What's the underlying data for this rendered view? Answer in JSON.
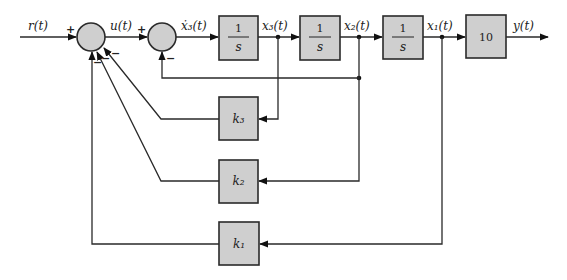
{
  "diagram": {
    "signals": {
      "input": "r(t)",
      "u": "u(t)",
      "x3dot": "ẋ₃(t)",
      "x3": "x₃(t)",
      "x2": "x₂(t)",
      "x1": "x₁(t)",
      "output": "y(t)"
    },
    "blocks": {
      "integrator1": {
        "num": "1",
        "den": "s"
      },
      "integrator2": {
        "num": "1",
        "den": "s"
      },
      "integrator3": {
        "num": "1",
        "den": "s"
      },
      "gain_out": "10",
      "k3": "k₃",
      "k2": "k₂",
      "k1": "k₁"
    },
    "summing_junctions": {
      "sum1": {
        "signs": {
          "r_in": "+",
          "k3_in": "−",
          "k2_in": "−",
          "k1_in": "−"
        }
      },
      "sum2": {
        "signs": {
          "u_in": "+",
          "fb_in": "−"
        }
      }
    },
    "colors": {
      "block_fill": "#cfcfcf",
      "stroke": "#2a2a2a"
    }
  }
}
